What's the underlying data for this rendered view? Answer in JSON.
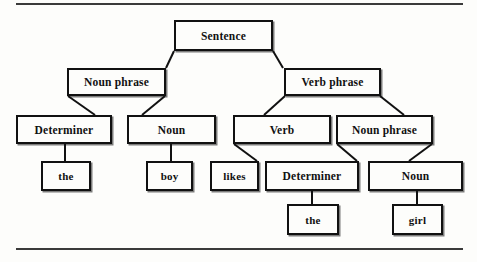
{
  "diagram": {
    "type": "constituency-tree",
    "sentence": "the boy likes the girl",
    "ink_color": "#111111",
    "background_color": "#fdfdfb",
    "nodes": [
      {
        "id": "s",
        "label": "Sentence",
        "role": "root",
        "x": 174,
        "y": 20,
        "w": 99,
        "h": 31
      },
      {
        "id": "np1",
        "label": "Noun phrase",
        "role": "phrase",
        "x": 67,
        "y": 68,
        "w": 99,
        "h": 28
      },
      {
        "id": "vp",
        "label": "Verb phrase",
        "role": "phrase",
        "x": 284,
        "y": 68,
        "w": 97,
        "h": 28
      },
      {
        "id": "det1",
        "label": "Determiner",
        "role": "category",
        "x": 16,
        "y": 115,
        "w": 96,
        "h": 29
      },
      {
        "id": "noun1",
        "label": "Noun",
        "role": "category",
        "x": 127,
        "y": 115,
        "w": 89,
        "h": 29
      },
      {
        "id": "verb",
        "label": "Verb",
        "role": "category",
        "x": 233,
        "y": 115,
        "w": 98,
        "h": 29
      },
      {
        "id": "np2",
        "label": "Noun phrase",
        "role": "phrase",
        "x": 336,
        "y": 115,
        "w": 97,
        "h": 29
      },
      {
        "id": "the1",
        "label": "the",
        "role": "word",
        "x": 41,
        "y": 161,
        "w": 50,
        "h": 30
      },
      {
        "id": "boy",
        "label": "boy",
        "role": "word",
        "x": 146,
        "y": 161,
        "w": 47,
        "h": 30
      },
      {
        "id": "likes",
        "label": "likes",
        "role": "word",
        "x": 210,
        "y": 161,
        "w": 49,
        "h": 30
      },
      {
        "id": "det2",
        "label": "Determiner",
        "role": "category",
        "x": 265,
        "y": 161,
        "w": 94,
        "h": 30
      },
      {
        "id": "noun2",
        "label": "Noun",
        "role": "category",
        "x": 368,
        "y": 161,
        "w": 95,
        "h": 30
      },
      {
        "id": "the2",
        "label": "the",
        "role": "word",
        "x": 287,
        "y": 204,
        "w": 52,
        "h": 31
      },
      {
        "id": "girl",
        "label": "girl",
        "role": "word",
        "x": 392,
        "y": 204,
        "w": 51,
        "h": 31
      }
    ],
    "edges": [
      {
        "from": "s",
        "to": "np1",
        "points": [
          [
            174,
            51
          ],
          [
            166,
            68
          ]
        ]
      },
      {
        "from": "s",
        "to": "vp",
        "points": [
          [
            273,
            51
          ],
          [
            283,
            68
          ]
        ]
      },
      {
        "from": "np1",
        "to": "det1",
        "points": [
          [
            68,
            96
          ],
          [
            95,
            115
          ]
        ]
      },
      {
        "from": "np1",
        "to": "noun1",
        "points": [
          [
            165,
            96
          ],
          [
            142,
            115
          ]
        ]
      },
      {
        "from": "vp",
        "to": "verb",
        "points": [
          [
            285,
            96
          ],
          [
            264,
            115
          ]
        ]
      },
      {
        "from": "vp",
        "to": "np2",
        "points": [
          [
            380,
            96
          ],
          [
            404,
            115
          ]
        ]
      },
      {
        "from": "det1",
        "to": "the1",
        "points": [
          [
            65,
            144
          ],
          [
            65,
            161
          ]
        ]
      },
      {
        "from": "noun1",
        "to": "boy",
        "points": [
          [
            171,
            144
          ],
          [
            171,
            161
          ]
        ]
      },
      {
        "from": "verb",
        "to": "likes",
        "points": [
          [
            234,
            144
          ],
          [
            257,
            161
          ]
        ]
      },
      {
        "from": "np2",
        "to": "det2",
        "points": [
          [
            337,
            144
          ],
          [
            357,
            161
          ]
        ]
      },
      {
        "from": "np2",
        "to": "noun2",
        "points": [
          [
            432,
            144
          ],
          [
            409,
            161
          ]
        ]
      },
      {
        "from": "det2",
        "to": "the2",
        "points": [
          [
            312,
            191
          ],
          [
            312,
            204
          ]
        ]
      },
      {
        "from": "noun2",
        "to": "girl",
        "points": [
          [
            417,
            191
          ],
          [
            417,
            204
          ]
        ]
      }
    ],
    "rules": [
      {
        "name": "top-rule",
        "x": 16,
        "y": 3,
        "w": 447
      },
      {
        "name": "bottom-rule",
        "x": 16,
        "y": 248,
        "w": 447
      }
    ]
  }
}
